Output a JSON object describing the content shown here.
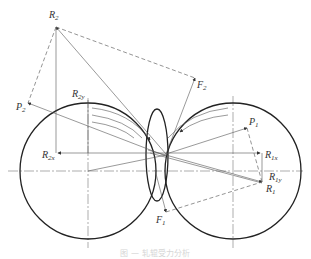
{
  "diagram": {
    "labels": {
      "R2": {
        "main": "R",
        "sub": "2"
      },
      "P2": {
        "main": "P",
        "sub": "2"
      },
      "F2": {
        "main": "F",
        "sub": "2"
      },
      "R2y": {
        "main": "R",
        "sub": "2y"
      },
      "R2x": {
        "main": "R",
        "sub": "2x"
      },
      "P1": {
        "main": "P",
        "sub": "1"
      },
      "R1x": {
        "main": "R",
        "sub": "1x"
      },
      "R1y": {
        "main": "R",
        "sub": "1y"
      },
      "R1": {
        "main": "R",
        "sub": "1"
      },
      "F1": {
        "main": "F",
        "sub": "1"
      }
    },
    "caption": "图 — 轧辊受力分析",
    "colors": {
      "line": "#222222",
      "thin_line": "#555555",
      "caption": "#d6d6d6"
    }
  }
}
